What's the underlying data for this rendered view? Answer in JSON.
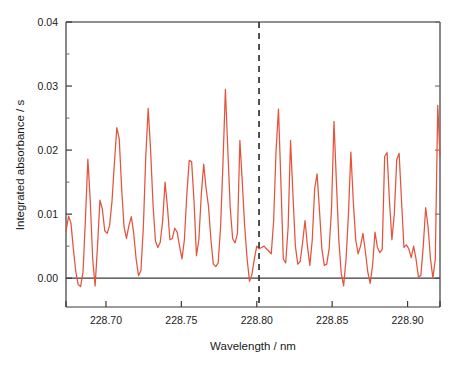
{
  "chart_data": {
    "type": "line",
    "title": "",
    "subtitle": "",
    "xlabel": "Wavelength / nm",
    "ylabel": "Integrated absorbance / s",
    "xlim": [
      228.6735,
      228.9215
    ],
    "ylim": [
      -0.0045,
      0.04
    ],
    "xticks": [
      228.7,
      228.75,
      228.8,
      228.85,
      228.9
    ],
    "xticklabels": [
      "228.70",
      "228.75",
      "228.80",
      "228.85",
      "228.90"
    ],
    "yticks": [
      0.0,
      0.01,
      0.02,
      0.03,
      0.04
    ],
    "yticklabels": [
      "0.00",
      "0.01",
      "0.02",
      "0.03",
      "0.04"
    ],
    "grid": false,
    "legend": null,
    "legend_position": "none",
    "line_color": "#E4533C",
    "zero_line": {
      "y": 0.0,
      "color": "#3a3a3a",
      "style": "solid"
    },
    "annotations": [
      {
        "name": "analytical-line-marker",
        "type": "vline",
        "x": 228.8015,
        "style": "dashed",
        "color": "#333333",
        "label": ""
      }
    ],
    "series": [
      {
        "name": "Integrated absorbance spectrum",
        "color": "#E4533C",
        "x": [
          228.6735,
          228.6752,
          228.6768,
          228.6784,
          228.68,
          228.6816,
          228.6832,
          228.6848,
          228.6864,
          228.688,
          228.6896,
          228.6912,
          228.6928,
          228.6944,
          228.696,
          228.6976,
          228.6992,
          228.7008,
          228.7024,
          228.704,
          228.7056,
          228.7072,
          228.7088,
          228.7104,
          228.712,
          228.7136,
          228.7152,
          228.7168,
          228.7184,
          228.72,
          228.7216,
          228.7232,
          228.7248,
          228.7264,
          228.728,
          228.7296,
          228.7312,
          228.7328,
          228.7344,
          228.736,
          228.7376,
          228.7392,
          228.7408,
          228.7424,
          228.744,
          228.7456,
          228.7472,
          228.7488,
          228.7504,
          228.752,
          228.7536,
          228.7552,
          228.7568,
          228.7584,
          228.76,
          228.7616,
          228.7632,
          228.7648,
          228.7664,
          228.768,
          228.7696,
          228.7712,
          228.7728,
          228.7744,
          228.776,
          228.7776,
          228.7792,
          228.7808,
          228.7824,
          228.784,
          228.7856,
          228.7872,
          228.7888,
          228.7904,
          228.792,
          228.7936,
          228.7952,
          228.7968,
          228.7984,
          228.8,
          228.8016,
          228.8032,
          228.8048,
          228.8064,
          228.808,
          228.8096,
          228.8112,
          228.8128,
          228.8144,
          228.816,
          228.8176,
          228.8192,
          228.8208,
          228.8224,
          228.824,
          228.8256,
          228.8272,
          228.8288,
          228.8304,
          228.832,
          228.8336,
          228.8352,
          228.8368,
          228.8384,
          228.84,
          228.8416,
          228.8432,
          228.8448,
          228.8464,
          228.848,
          228.8496,
          228.8512,
          228.8528,
          228.8544,
          228.856,
          228.8576,
          228.8592,
          228.8608,
          228.8624,
          228.864,
          228.8656,
          228.8672,
          228.8688,
          228.8704,
          228.872,
          228.8736,
          228.8752,
          228.8768,
          228.8784,
          228.88,
          228.8816,
          228.8832,
          228.8848,
          228.8864,
          228.888,
          228.8896,
          228.8912,
          228.8928,
          228.8944,
          228.896,
          228.8976,
          228.8992,
          228.9008,
          228.9024,
          228.904,
          228.9056,
          228.9072,
          228.9088,
          228.9104,
          228.912,
          228.9136,
          228.9152,
          228.9168,
          228.9184,
          228.92,
          228.9215
        ],
        "y": [
          0.0073,
          0.0097,
          0.0086,
          0.0045,
          0.001,
          -0.001,
          -0.0013,
          0.001,
          0.0093,
          0.0186,
          0.012,
          0.003,
          -0.0012,
          0.005,
          0.0122,
          0.0108,
          0.0074,
          0.007,
          0.0082,
          0.012,
          0.018,
          0.0235,
          0.0218,
          0.014,
          0.008,
          0.0062,
          0.0082,
          0.0096,
          0.007,
          0.003,
          0.0004,
          0.0012,
          0.008,
          0.019,
          0.0265,
          0.02,
          0.0115,
          0.0058,
          0.0048,
          0.0056,
          0.009,
          0.015,
          0.011,
          0.006,
          0.0062,
          0.0078,
          0.0072,
          0.005,
          0.003,
          0.006,
          0.013,
          0.0184,
          0.0182,
          0.012,
          0.0035,
          0.006,
          0.013,
          0.0178,
          0.014,
          0.0112,
          0.006,
          0.0022,
          0.0018,
          0.0024,
          0.008,
          0.018,
          0.0295,
          0.02,
          0.011,
          0.0062,
          0.0055,
          0.007,
          0.0215,
          0.015,
          0.008,
          0.003,
          -0.0005,
          0.0006,
          0.003,
          0.005,
          0.0046,
          0.0048,
          0.005,
          0.0046,
          0.0042,
          0.0038,
          0.009,
          0.02,
          0.0264,
          0.015,
          0.003,
          0.0024,
          0.008,
          0.0215,
          0.013,
          0.005,
          0.0022,
          0.0026,
          0.0056,
          0.009,
          0.005,
          0.002,
          0.006,
          0.014,
          0.0163,
          0.0105,
          0.0045,
          0.002,
          0.0022,
          0.0046,
          0.011,
          0.0245,
          0.015,
          0.006,
          0.0008,
          -0.0012,
          0.003,
          0.01,
          0.0197,
          0.012,
          0.006,
          0.0038,
          0.005,
          0.007,
          0.0042,
          0.001,
          -0.0008,
          0.002,
          0.0072,
          0.0048,
          0.004,
          0.0045,
          0.019,
          0.0196,
          0.012,
          0.006,
          0.01,
          0.0185,
          0.0195,
          0.012,
          0.0048,
          0.0052,
          0.0046,
          0.0032,
          0.005,
          0.003,
          0.0002,
          0.0004,
          0.005,
          0.011,
          0.008,
          0.003,
          0.0,
          0.003,
          0.027,
          0.019
        ]
      }
    ],
    "peaks_of_interest": [
      {
        "x": 228.7792,
        "y": 0.0295,
        "note": "tallest peak"
      },
      {
        "x": 228.904,
        "y": 0.027
      },
      {
        "x": 228.8144,
        "y": 0.0264
      },
      {
        "x": 228.728,
        "y": 0.0265
      },
      {
        "x": 228.8512,
        "y": 0.0245
      },
      {
        "x": 228.7072,
        "y": 0.0235
      },
      {
        "x": 228.7888,
        "y": 0.0215
      },
      {
        "x": 228.8224,
        "y": 0.0215
      }
    ]
  },
  "figure": {
    "background_color": "#ffffff",
    "frame_color": "#6b6b6b"
  }
}
